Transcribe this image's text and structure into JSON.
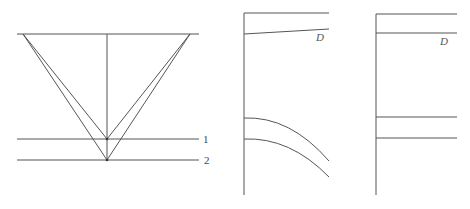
{
  "figures": [
    {
      "id": "ray-geometry",
      "description": "Reflection ray paths from surface to two horizontal reflectors",
      "surface": {
        "x1": 17,
        "x2": 199,
        "y": 34
      },
      "center_line": {
        "x": 107,
        "y1": 34,
        "y2": 160
      },
      "reflectors": [
        {
          "label": "1",
          "y": 139,
          "x1": 17,
          "x2": 199
        },
        {
          "label": "2",
          "y": 160,
          "x1": 17,
          "x2": 199
        }
      ],
      "rays": [
        {
          "from": [
            23,
            34
          ],
          "to": [
            107,
            139
          ]
        },
        {
          "from": [
            190,
            34
          ],
          "to": [
            107,
            139
          ]
        },
        {
          "from": [
            23,
            34
          ],
          "to": [
            107,
            160
          ]
        },
        {
          "from": [
            190,
            34
          ],
          "to": [
            107,
            160
          ]
        }
      ]
    },
    {
      "id": "traveltime-uncorrected",
      "direct_label": "D",
      "axis": {
        "x": 244,
        "y1": 13,
        "y2": 195
      },
      "top_line": {
        "x1": 244,
        "x2": 329,
        "y": 13
      },
      "direct_line": {
        "x1": 244,
        "y1": 34,
        "x2": 329,
        "y2": 29
      },
      "curves": [
        {
          "start": [
            244,
            118
          ],
          "ctrl": [
            285,
            118
          ],
          "end": [
            329,
            160
          ]
        },
        {
          "start": [
            244,
            139
          ],
          "ctrl": [
            285,
            139
          ],
          "end": [
            329,
            176
          ]
        }
      ]
    },
    {
      "id": "traveltime-corrected",
      "direct_label": "D",
      "axis": {
        "x": 376,
        "y1": 14,
        "y2": 195
      },
      "top_line": {
        "x1": 376,
        "x2": 457,
        "y": 14
      },
      "direct_line": {
        "x1": 376,
        "x2": 457,
        "y": 33
      },
      "flat_lines": [
        {
          "y": 117,
          "x1": 376,
          "x2": 457
        },
        {
          "y": 138,
          "x1": 376,
          "x2": 457
        }
      ]
    }
  ],
  "labels": {
    "reflector_1": "1",
    "reflector_2": "2",
    "direct_mid": "D",
    "direct_right": "D"
  }
}
